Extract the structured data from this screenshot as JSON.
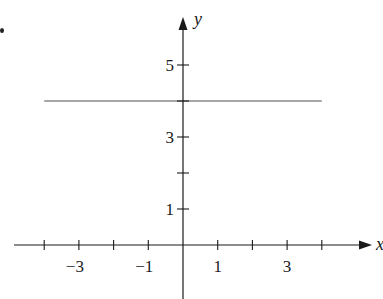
{
  "chart_data": {
    "type": "line",
    "title": "",
    "xlabel": "x",
    "ylabel": "y",
    "xlim": [
      -4.9,
      5.4
    ],
    "ylim": [
      -1.5,
      6.3
    ],
    "grid": false,
    "legend": null,
    "x_ticks": [
      -4,
      -3,
      -2,
      -1,
      1,
      2,
      3,
      4
    ],
    "x_tick_labels": [
      {
        "value": -3,
        "label": "−3"
      },
      {
        "value": -1,
        "label": "−1"
      },
      {
        "value": 1,
        "label": "1"
      },
      {
        "value": 3,
        "label": "3"
      }
    ],
    "y_ticks": [
      1,
      2,
      3,
      4,
      5
    ],
    "y_tick_labels": [
      {
        "value": 1,
        "label": "1"
      },
      {
        "value": 3,
        "label": "3"
      },
      {
        "value": 5,
        "label": "5"
      }
    ],
    "series": [
      {
        "name": "y = 4",
        "x": [
          -4,
          4
        ],
        "y": [
          4,
          4
        ],
        "color": "#8a8a8a"
      }
    ],
    "colors": {
      "axis": "#1a1a1a",
      "line": "#8a8a8a"
    }
  }
}
